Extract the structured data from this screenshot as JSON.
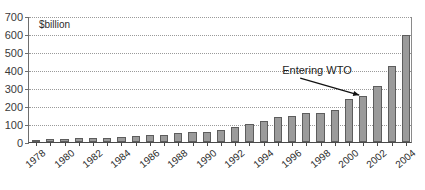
{
  "chart_data": {
    "type": "bar",
    "title": "",
    "subtitle": "",
    "unit_label": "$billion",
    "xlabel": "",
    "ylabel": "",
    "ylim": [
      0,
      700
    ],
    "ytick_step": 100,
    "yticks": [
      0,
      100,
      200,
      300,
      400,
      500,
      600,
      700
    ],
    "ytick_labels": [
      "0",
      "100",
      "200",
      "300",
      "400",
      "500",
      "600",
      "700"
    ],
    "grid": true,
    "grid_axis": "y",
    "legend": false,
    "legend_position": "none",
    "bar_color": "#9b9b9b",
    "bar_edge_color": "#5d5d5d",
    "categories": [
      "1978",
      "1979",
      "1980",
      "1981",
      "1982",
      "1983",
      "1984",
      "1985",
      "1986",
      "1987",
      "1988",
      "1989",
      "1990",
      "1991",
      "1992",
      "1993",
      "1994",
      "1995",
      "1996",
      "1997",
      "1998",
      "1999",
      "2000",
      "2001",
      "2002",
      "2003",
      "2004"
    ],
    "xtick_labels": [
      "1978",
      "1980",
      "1982",
      "1984",
      "1986",
      "1988",
      "1990",
      "1992",
      "1994",
      "1996",
      "1998",
      "2000",
      "2002",
      "2004"
    ],
    "values": [
      21,
      29,
      38,
      44,
      42,
      44,
      54,
      70,
      74,
      83,
      103,
      112,
      115,
      136,
      166,
      196,
      236,
      281,
      290,
      325,
      324,
      361,
      474,
      510,
      621,
      851,
      1155
    ],
    "values_plotted": [
      10,
      14,
      19,
      22,
      21,
      22,
      27,
      35,
      37,
      41,
      51,
      56,
      57,
      68,
      83,
      98,
      118,
      140,
      145,
      162,
      162,
      180,
      237,
      255,
      310,
      425,
      595
    ],
    "annotations": [
      {
        "text": "Entering WTO",
        "points_to_category": "2001",
        "points_to_value": 255
      }
    ]
  }
}
